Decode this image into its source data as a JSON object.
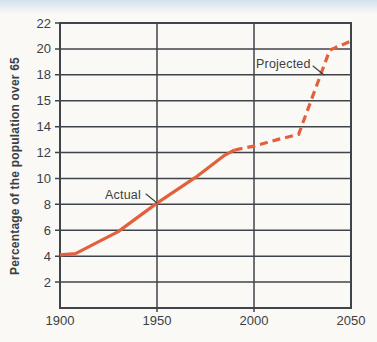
{
  "page": {
    "background": "#faf9f5",
    "top_band_color": "#d3e2ee"
  },
  "chart_data": {
    "type": "line",
    "title": "",
    "xlabel": "",
    "ylabel": "Percentage of the population over 65",
    "x_range": [
      1900,
      2050
    ],
    "y_range": [
      0,
      22
    ],
    "x_ticks": [
      {
        "value": 1900,
        "label": "1900"
      },
      {
        "value": 1950,
        "label": "1950"
      },
      {
        "value": 2000,
        "label": "2000"
      },
      {
        "value": 2050,
        "label": "2050"
      }
    ],
    "y_ticks": [
      {
        "value": 22,
        "label": "22"
      },
      {
        "value": 20,
        "label": "20"
      },
      {
        "value": 18,
        "label": "18"
      },
      {
        "value": 16,
        "label": "15"
      },
      {
        "value": 14,
        "label": "14"
      },
      {
        "value": 12,
        "label": "12"
      },
      {
        "value": 10,
        "label": "10"
      },
      {
        "value": 8,
        "label": "8"
      },
      {
        "value": 6,
        "label": "6"
      },
      {
        "value": 4,
        "label": "4"
      },
      {
        "value": 2,
        "label": "2"
      }
    ],
    "grid": true,
    "legend_position": "none",
    "series": [
      {
        "name": "Actual",
        "style": "solid",
        "color": "#e2613c",
        "points": [
          [
            1900,
            4.1
          ],
          [
            1908,
            4.2
          ],
          [
            1930,
            5.9
          ],
          [
            1950,
            8.1
          ],
          [
            1970,
            10.1
          ],
          [
            1985,
            11.8
          ],
          [
            1990,
            12.2
          ]
        ]
      },
      {
        "name": "Projected",
        "style": "dashed",
        "color": "#e2613c",
        "points": [
          [
            1990,
            12.2
          ],
          [
            2000,
            12.5
          ],
          [
            2012,
            13.0
          ],
          [
            2023,
            13.4
          ],
          [
            2039,
            19.9
          ],
          [
            2042,
            20.1
          ],
          [
            2050,
            20.6
          ]
        ]
      }
    ],
    "annotations": [
      {
        "text": "Actual"
      },
      {
        "text": "Projected"
      }
    ],
    "colors": {
      "grid": "#3f444a",
      "text": "#3a3f45",
      "line": "#e2613c"
    }
  }
}
